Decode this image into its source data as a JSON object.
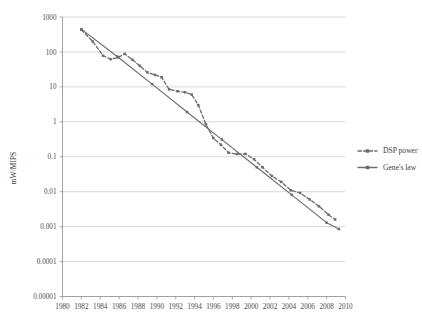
{
  "chart_data": {
    "type": "line",
    "title": "",
    "xlabel": "",
    "ylabel": "mW/MIPS",
    "yscale": "log",
    "ylim": [
      1e-05,
      1000
    ],
    "xlim": [
      1980,
      2010
    ],
    "grid": true,
    "legend_position": "right",
    "y_ticks": [
      "1000",
      "100",
      "10",
      "1",
      "0.1",
      "0.01",
      "0.001",
      "0.0001",
      "0.00001"
    ],
    "y_tick_values": [
      1000,
      100,
      10,
      1,
      0.1,
      0.01,
      0.001,
      0.0001,
      1e-05
    ],
    "x_ticks": [
      "1980",
      "1982",
      "1984",
      "1986",
      "1988",
      "1990",
      "1992",
      "1994",
      "1996",
      "1998",
      "2000",
      "2002",
      "2004",
      "2006",
      "2008",
      "2010"
    ],
    "x_tick_values": [
      1980,
      1982,
      1984,
      1986,
      1988,
      1990,
      1992,
      1994,
      1996,
      1998,
      2000,
      2002,
      2004,
      2006,
      2008,
      2010
    ],
    "series": [
      {
        "name": "DSP power",
        "style": "dashed",
        "color": "#6b6b6b",
        "marker": "square",
        "x": [
          1982,
          1983.2,
          1984.3,
          1985.1,
          1985.9,
          1986.6,
          1987.4,
          1988.2,
          1989.0,
          1989.8,
          1990.5,
          1991.3,
          1992.2,
          1993.0,
          1993.7,
          1994.4,
          1995.2,
          1996.0,
          1996.8,
          1997.6,
          1998.5,
          1999.4,
          2000.3,
          2001.2,
          2002.2,
          2003.2,
          2004.2,
          2005.2,
          2006.2,
          2007.2,
          2008.2,
          2008.9
        ],
        "y": [
          430,
          200,
          78,
          62,
          70,
          88,
          60,
          40,
          26,
          22,
          19,
          8.5,
          7.5,
          7.0,
          6.0,
          3.0,
          0.85,
          0.34,
          0.22,
          0.13,
          0.12,
          0.12,
          0.085,
          0.05,
          0.028,
          0.019,
          0.011,
          0.0092,
          0.006,
          0.0038,
          0.0022,
          0.0016
        ]
      },
      {
        "name": "Gene's law",
        "style": "solid",
        "color": "#6b6b6b",
        "marker": "square",
        "x": [
          1982,
          1985.8,
          1989.5,
          1993.2,
          1996.9,
          2000.6,
          2004.3,
          2008.0,
          2009.3
        ],
        "y": [
          450,
          74,
          12,
          1.9,
          0.31,
          0.05,
          0.0081,
          0.0013,
          0.00085
        ]
      }
    ],
    "legend": [
      {
        "label": "DSP power",
        "style": "dashed",
        "marker": "square"
      },
      {
        "label": "Gene's law",
        "style": "solid",
        "marker": "square"
      }
    ]
  }
}
